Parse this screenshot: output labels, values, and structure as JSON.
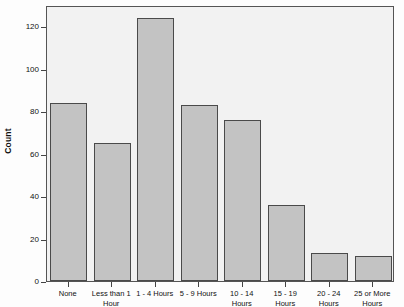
{
  "chart_data": {
    "type": "bar",
    "title": "",
    "subtitle": "",
    "xlabel": "",
    "ylabel": "Count",
    "categories": [
      "None",
      "Less than 1 Hour",
      "1 - 4 Hours",
      "5 - 9 Hours",
      "10 - 14 Hours",
      "15 - 19 Hours",
      "20 - 24 Hours",
      "25 or More Hours"
    ],
    "values": [
      84,
      65,
      124,
      83,
      76,
      36,
      13,
      12
    ],
    "ylim": [
      0,
      130
    ],
    "yticks": [
      0,
      20,
      40,
      60,
      80,
      100,
      120
    ],
    "ytick_labels": [
      "0",
      "20",
      "40",
      "60",
      "80",
      "100",
      "120"
    ],
    "grid": false,
    "legend": "none",
    "bar_color": "#c3c3c3",
    "bar_border_color": "#4a4a4a",
    "plot_background": "#f2f2f2",
    "axis_color": "#555555"
  },
  "layout": {
    "category_label_lines": [
      [
        "None"
      ],
      [
        "Less than 1",
        "Hour"
      ],
      [
        "1 - 4 Hours"
      ],
      [
        "5 - 9 Hours"
      ],
      [
        "10 - 14",
        "Hours"
      ],
      [
        "15 - 19",
        "Hours"
      ],
      [
        "20 - 24",
        "Hours"
      ],
      [
        "25 or  More",
        "Hours"
      ]
    ]
  }
}
